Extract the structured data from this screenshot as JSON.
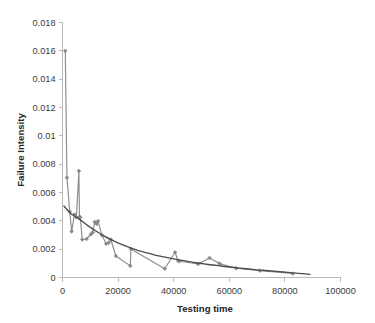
{
  "chart_data": {
    "type": "line",
    "title": "",
    "xlabel": "Testing time",
    "ylabel": "Failure Intensity",
    "xlim": [
      0,
      100000
    ],
    "ylim": [
      0,
      0.018
    ],
    "grid": false,
    "legend": false,
    "legend_position": "none",
    "x_ticks": [
      0,
      20000,
      40000,
      60000,
      80000,
      100000
    ],
    "x_tick_labels": [
      "0",
      "20000",
      "40000",
      "60000",
      "80000",
      "100000"
    ],
    "y_ticks": [
      0,
      0.002,
      0.004,
      0.006,
      0.008,
      0.01,
      0.012,
      0.014,
      0.016,
      0.018
    ],
    "y_tick_labels": [
      "0",
      "0.002",
      "0.004",
      "0.006",
      "0.008",
      "0.01",
      "0.012",
      "0.014",
      "0.016",
      "0.018"
    ],
    "series": [
      {
        "name": "Observed failure intensity",
        "type": "line-markers",
        "color": "#8c8c8c",
        "marker": "diamond",
        "points": [
          [
            1000,
            0.016
          ],
          [
            1600,
            0.00705
          ],
          [
            2600,
            0.00465
          ],
          [
            3300,
            0.00325
          ],
          [
            4300,
            0.00445
          ],
          [
            5000,
            0.00425
          ],
          [
            5900,
            0.00752
          ],
          [
            6100,
            0.00428
          ],
          [
            6400,
            0.00425
          ],
          [
            7100,
            0.00268
          ],
          [
            8700,
            0.00272
          ],
          [
            10200,
            0.00305
          ],
          [
            10900,
            0.00318
          ],
          [
            11600,
            0.00392
          ],
          [
            12300,
            0.00378
          ],
          [
            12800,
            0.00398
          ],
          [
            14200,
            0.00298
          ],
          [
            15700,
            0.00238
          ],
          [
            16600,
            0.00245
          ],
          [
            17400,
            0.00268
          ],
          [
            19200,
            0.00152
          ],
          [
            24400,
            0.00082
          ],
          [
            24600,
            0.00202
          ],
          [
            36800,
            0.00062
          ],
          [
            40500,
            0.00178
          ],
          [
            41600,
            0.00118
          ],
          [
            42000,
            0.00115
          ],
          [
            48800,
            0.00095
          ],
          [
            52900,
            0.00138
          ],
          [
            56500,
            0.00098
          ],
          [
            62500,
            0.00065
          ],
          [
            71000,
            0.00048
          ],
          [
            82800,
            0.00028
          ]
        ]
      },
      {
        "name": "Fitted model curve",
        "type": "line",
        "color": "#4d4d4d",
        "marker": "none",
        "points": [
          [
            500,
            0.00505
          ],
          [
            3000,
            0.00452
          ],
          [
            6000,
            0.00412
          ],
          [
            9000,
            0.00368
          ],
          [
            12000,
            0.00328
          ],
          [
            15000,
            0.00292
          ],
          [
            18000,
            0.00262
          ],
          [
            21000,
            0.00235
          ],
          [
            24000,
            0.00212
          ],
          [
            27000,
            0.00192
          ],
          [
            30000,
            0.00175
          ],
          [
            33000,
            0.0016
          ],
          [
            36000,
            0.00147
          ],
          [
            39000,
            0.00135
          ],
          [
            42000,
            0.00124
          ],
          [
            45000,
            0.00114
          ],
          [
            48000,
            0.00104
          ],
          [
            51000,
            0.00096
          ],
          [
            54000,
            0.00088
          ],
          [
            57000,
            0.00081
          ],
          [
            60000,
            0.00074
          ],
          [
            63000,
            0.00068
          ],
          [
            66000,
            0.00062
          ],
          [
            69000,
            0.00056
          ],
          [
            72000,
            0.00051
          ],
          [
            75000,
            0.00046
          ],
          [
            78000,
            0.00041
          ],
          [
            81000,
            0.00036
          ],
          [
            84000,
            0.00031
          ],
          [
            86500,
            0.00027
          ],
          [
            89000,
            0.00022
          ]
        ]
      }
    ]
  }
}
